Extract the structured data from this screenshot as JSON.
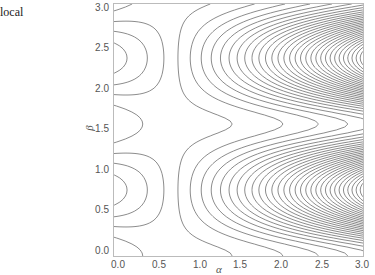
{
  "caption_label": "local",
  "chart_data": {
    "type": "contour",
    "title": "",
    "xlabel": "α",
    "ylabel": "β",
    "xlim": [
      0.0,
      3.0
    ],
    "ylim": [
      0.0,
      3.0
    ],
    "x_ticks": [
      "0.0",
      "0.5",
      "1.0",
      "1.5",
      "2.0",
      "2.5",
      "3.0"
    ],
    "y_ticks": [
      "0.0",
      "0.5",
      "1.0",
      "1.5",
      "2.0",
      "2.5",
      "3.0"
    ],
    "grid": false,
    "legend": null,
    "line_color": "#6e6e6e",
    "features": {
      "closed_loops": [
        {
          "alpha": 0.4,
          "beta": 2.4
        },
        {
          "alpha": 0.45,
          "beta": 0.6
        }
      ],
      "dense_bands_beta": [
        0.2,
        1.25,
        1.7
      ],
      "open_band_beta": [
        1.5,
        0.9,
        2.1
      ]
    }
  }
}
